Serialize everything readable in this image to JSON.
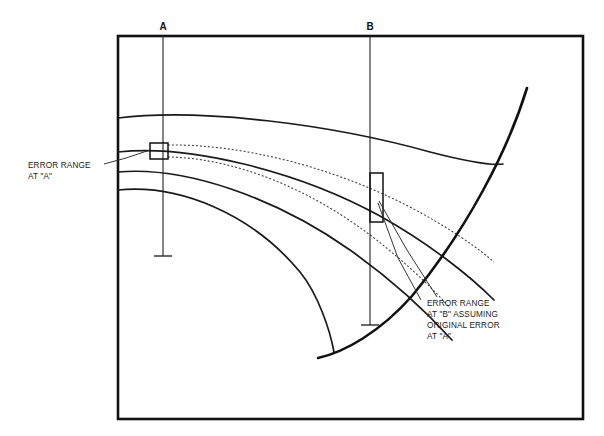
{
  "figure": {
    "type": "technical-line-diagram",
    "background_color": "#ffffff",
    "line_color": "#111111",
    "border": {
      "x": 118,
      "y": 36,
      "width": 465,
      "height": 383
    }
  },
  "markers": [
    {
      "id": "A",
      "label": "A",
      "label_x": 163,
      "label_y": 30,
      "line_x": 163,
      "line_top": 36,
      "line_bottom": 256,
      "tick_half_width": 9
    },
    {
      "id": "B",
      "label": "B",
      "label_x": 370,
      "label_y": 30,
      "line_x": 370,
      "line_top": 36,
      "line_bottom": 325,
      "tick_half_width": 9
    }
  ],
  "annotations": [
    {
      "name": "error-range-at-a",
      "lines": [
        "ERROR RANGE",
        "AT \"A\""
      ],
      "text_x": 28,
      "text_y": 168,
      "line_height": 11,
      "leader": [
        [
          104,
          164
        ],
        [
          126,
          158
        ],
        [
          150,
          150
        ]
      ],
      "box": {
        "x": 150,
        "y": 143,
        "width": 18,
        "height": 16
      }
    },
    {
      "name": "error-range-at-b",
      "lines": [
        "ERROR RANGE",
        "AT \"B\" ASSUMING",
        "ORIGINAL ERROR",
        "AT \"A\""
      ],
      "text_x": 427,
      "text_y": 306,
      "line_height": 11,
      "leaders": [
        [
          [
            421,
            300
          ],
          [
            398,
            258
          ],
          [
            378,
            203
          ]
        ],
        [
          [
            437,
            297
          ],
          [
            407,
            250
          ],
          [
            379,
            201
          ]
        ]
      ],
      "box": {
        "x": 370,
        "y": 173,
        "width": 13,
        "height": 49
      }
    }
  ],
  "curves": {
    "solid_thin": [
      {
        "name": "curve-1-top",
        "path": "M 118 118 C 200 108, 330 124, 430 152 C 465 161, 490 166, 503 164"
      },
      {
        "name": "curve-2",
        "path": "M 118 152 C 190 144, 300 172, 380 216 C 430 244, 470 276, 494 300"
      },
      {
        "name": "curve-3",
        "path": "M 118 172 C 186 166, 276 198, 350 250 C 398 284, 432 318, 452 340"
      },
      {
        "name": "curve-4-bottom",
        "path": "M 118 190 C 180 184, 252 214, 300 272 C 318 294, 330 330, 334 352"
      }
    ],
    "solid_thick": [
      {
        "name": "boundary-curve-right",
        "path": "M 527 88 C 508 150, 468 228, 412 296 C 380 332, 345 352, 318 358"
      }
    ],
    "dotted": [
      {
        "name": "dotted-upper",
        "path": "M 168 145 C 240 144, 330 166, 408 206 C 450 228, 478 248, 494 262"
      },
      {
        "name": "dotted-lower",
        "path": "M 168 157 C 236 158, 312 190, 374 238 C 410 266, 436 292, 450 308"
      }
    ]
  }
}
